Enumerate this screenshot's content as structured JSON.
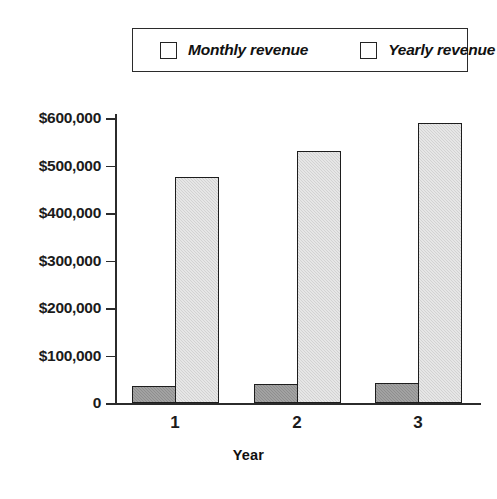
{
  "chart_data": {
    "type": "bar",
    "title": "",
    "xlabel": "Year",
    "ylabel": "",
    "categories": [
      "1",
      "2",
      "3"
    ],
    "series": [
      {
        "name": "Monthly revenue",
        "values": [
          36000,
          40000,
          42000
        ],
        "color": "#8e8e8e"
      },
      {
        "name": "Yearly revenue",
        "values": [
          475000,
          530000,
          590000
        ],
        "color": "#d2d2d2"
      }
    ],
    "ylim": [
      0,
      600000
    ],
    "ytick_values": [
      600000,
      500000,
      400000,
      300000,
      200000,
      100000,
      0
    ],
    "ytick_labels": [
      "$600,000",
      "$500,000",
      "$400,000",
      "$300,000",
      "$200,000",
      "$100,000",
      "0"
    ],
    "grid": false,
    "legend_position": "top",
    "legend": [
      "Monthly revenue",
      "Yearly revenue"
    ]
  },
  "legend": {
    "monthly": {
      "label": "Monthly revenue",
      "swatch": "legend-swatch-monthly"
    },
    "yearly": {
      "label": "Yearly revenue",
      "swatch": "legend-swatch-yearly"
    }
  },
  "axes": {
    "x_title": "Year",
    "categories": [
      "1",
      "2",
      "3"
    ],
    "y_labels": [
      "$600,000",
      "$500,000",
      "$400,000",
      "$300,000",
      "$200,000",
      "$100,000",
      "0"
    ]
  }
}
